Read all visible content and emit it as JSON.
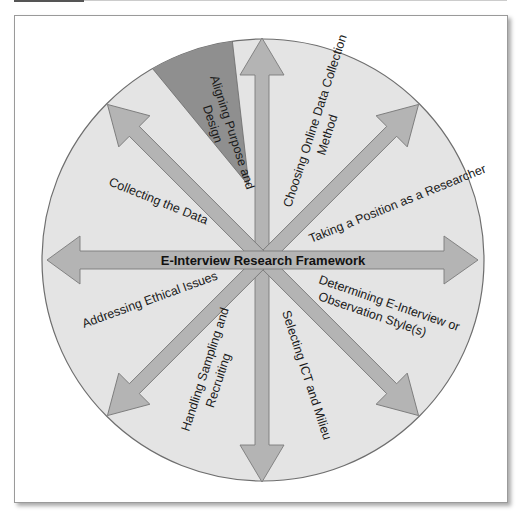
{
  "diagram": {
    "title": "E-Interview Research Framework",
    "segments": [
      {
        "label_lines": [
          "Aligning Purpose and",
          "Design"
        ],
        "highlighted": true
      },
      {
        "label_lines": [
          "Choosing Online Data Collection",
          "Method"
        ]
      },
      {
        "label_lines": [
          "Taking a Position as a Researcher"
        ]
      },
      {
        "label_lines": [
          "Determining E-Interview or",
          "Observation Style(s)"
        ]
      },
      {
        "label_lines": [
          "Selecting ICT and Milieu"
        ]
      },
      {
        "label_lines": [
          "Handling Sampling and",
          "Recruiting"
        ]
      },
      {
        "label_lines": [
          "Addressing Ethical Issues"
        ]
      },
      {
        "label_lines": [
          "Collecting the Data"
        ]
      }
    ],
    "colors": {
      "circle_fill": "#e4e4e4",
      "circle_stroke": "#6e6e6e",
      "arrow_fill": "#b4b4b4",
      "arrow_stroke": "#7a7a7a",
      "highlight_wedge": "#8f8f8f"
    }
  }
}
